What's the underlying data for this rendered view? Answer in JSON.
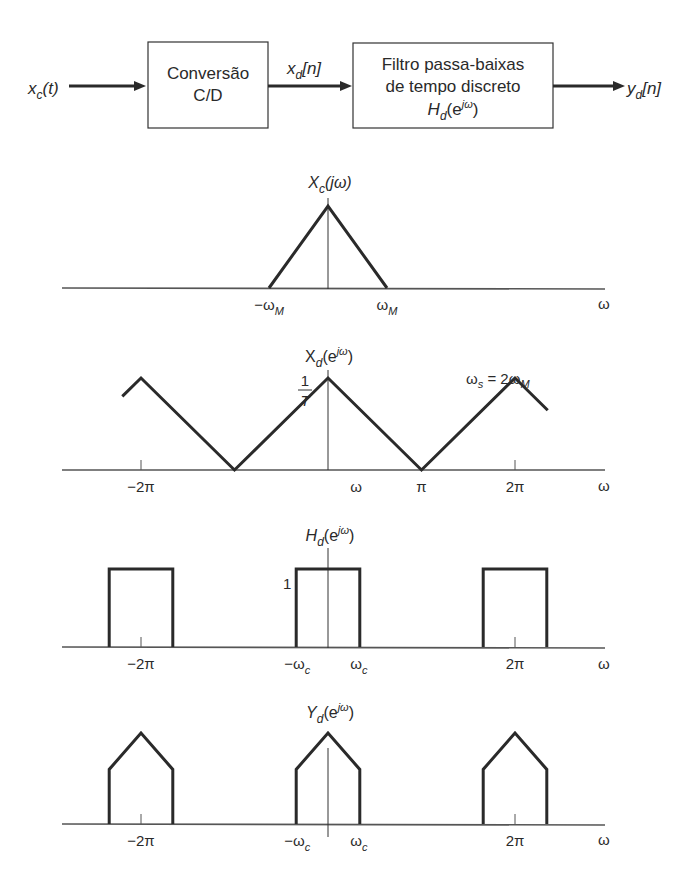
{
  "block_diagram": {
    "input_signal": {
      "main": "x",
      "sub": "c",
      "rest": "(t)"
    },
    "block1": {
      "line1": "Conversão",
      "line2": "C/D"
    },
    "mid_signal": {
      "main": "x",
      "sub": "d",
      "rest": "[n]"
    },
    "block2": {
      "line1": "Filtro passa-baixas",
      "line2": "de tempo discreto",
      "line3_main": "H",
      "line3_sub": "d",
      "line3_rest": "(e",
      "line3_sup": "jω",
      "line3_close": ")"
    },
    "output_signal": {
      "main": "y",
      "sub": "d",
      "rest": "[n]"
    }
  },
  "chart_data": [
    {
      "type": "line",
      "title": {
        "main": "X",
        "sub": "c",
        "rest": "(jω)"
      },
      "xlabel": "ω",
      "tick_labels": [
        {
          "x": -1,
          "main": "−ω",
          "sub": "M"
        },
        {
          "x": 1,
          "main": "ω",
          "sub": "M"
        }
      ],
      "series": [
        {
          "name": "Xc(jω)",
          "x": [
            -1,
            0,
            1
          ],
          "y": [
            0,
            1,
            0
          ]
        }
      ],
      "xlim": [
        -2.9,
        2.9
      ],
      "ylim": [
        0,
        1.25
      ],
      "note": "x in units of ωM"
    },
    {
      "type": "line",
      "title": {
        "main": "X",
        "sub": "d",
        "rest": "(e",
        "sup": "jω",
        "close": ")"
      },
      "peak_label": {
        "num": "1",
        "den": "T"
      },
      "annotation": {
        "main": "ω",
        "sub": "s",
        "mid": " = 2ω",
        "sub2": "M"
      },
      "xlabel": "ω",
      "tick_labels": [
        {
          "x": -2,
          "text": "−2π"
        },
        {
          "x": 0.3,
          "text": "ω"
        },
        {
          "x": 1,
          "text": "π"
        },
        {
          "x": 2,
          "text": "2π"
        }
      ],
      "series": [
        {
          "name": "Xd(e^jω)",
          "x": [
            -2.2,
            -2,
            -1,
            0,
            1,
            2,
            2.35
          ],
          "y": [
            0.8,
            1,
            0,
            1,
            0,
            1,
            0.65
          ]
        }
      ],
      "xlim": [
        -2.9,
        2.9
      ],
      "ylim": [
        0,
        1.25
      ],
      "note": "x in units of π"
    },
    {
      "type": "line",
      "title": {
        "main": "H",
        "sub": "d",
        "rest": "(e",
        "sup": "jω",
        "close": ")"
      },
      "level_label": "1",
      "xlabel": "ω",
      "tick_labels": [
        {
          "x": -2,
          "text": "−2π"
        },
        {
          "x": -0.33,
          "main": "−ω",
          "sub": "c"
        },
        {
          "x": 0.33,
          "main": "ω",
          "sub": "c"
        },
        {
          "x": 2,
          "text": "2π"
        }
      ],
      "series": [
        {
          "name": "Hd(e^jω)",
          "pulses": [
            {
              "center": -2,
              "half_width": 0.34
            },
            {
              "center": 0,
              "half_width": 0.34
            },
            {
              "center": 2,
              "half_width": 0.34
            }
          ],
          "height": 1
        }
      ],
      "xlim": [
        -2.9,
        2.9
      ],
      "ylim": [
        0,
        1.8
      ],
      "note": "x in units of π"
    },
    {
      "type": "line",
      "title": {
        "main": "Y",
        "sub": "d",
        "rest": "(e",
        "sup": "jω",
        "close": ")"
      },
      "xlabel": "ω",
      "tick_labels": [
        {
          "x": -2,
          "text": "−2π"
        },
        {
          "x": -0.33,
          "main": "−ω",
          "sub": "c"
        },
        {
          "x": 0.33,
          "main": "ω",
          "sub": "c"
        },
        {
          "x": 2,
          "text": "2π"
        }
      ],
      "series": [
        {
          "name": "Yd(e^jω)",
          "pulses": [
            {
              "center": -2,
              "half_width": 0.34
            },
            {
              "center": 0,
              "half_width": 0.34
            },
            {
              "center": 2,
              "half_width": 0.34
            }
          ],
          "peak": 1,
          "edge": 0.6
        }
      ],
      "xlim": [
        -2.9,
        2.9
      ],
      "ylim": [
        0,
        1.25
      ],
      "note": "x in units of π"
    }
  ]
}
